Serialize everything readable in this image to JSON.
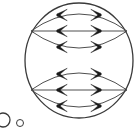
{
  "figure": {
    "background_color": "#ffffff",
    "stroke_color": "#3a3a3a",
    "fill_color": "#1a1a1a",
    "canvas": {
      "width": 140,
      "height": 139
    },
    "outer_circle": {
      "name": "outer-boundary-circle",
      "cx": 79,
      "cy": 60.5,
      "rx": 54,
      "ry": 57.5,
      "stroke_width": 1.3
    },
    "divider_line": {
      "name": "horizontal-divider",
      "x1": 25,
      "y1": 60.5,
      "x2": 133,
      "y2": 60.5,
      "stroke_width": 1.3
    },
    "halves": [
      {
        "name": "upper-half",
        "lens": {
          "left_tip_x": 31,
          "right_tip_x": 127,
          "center_y": 31,
          "bulge": 17
        },
        "midline": {
          "x1": 33,
          "x2": 125,
          "y": 31,
          "stroke_width": 0.9
        },
        "chevrons_left": [
          {
            "cx": 62,
            "cy": 15
          },
          {
            "cx": 62,
            "cy": 31
          },
          {
            "cx": 62,
            "cy": 47
          }
        ],
        "chevrons_right": [
          {
            "cx": 96,
            "cy": 15
          },
          {
            "cx": 96,
            "cy": 31
          },
          {
            "cx": 96,
            "cy": 47
          }
        ]
      },
      {
        "name": "lower-half",
        "lens": {
          "left_tip_x": 31,
          "right_tip_x": 127,
          "center_y": 90,
          "bulge": 17
        },
        "midline": {
          "x1": 33,
          "x2": 125,
          "y": 90,
          "stroke_width": 0.9
        },
        "chevrons_left": [
          {
            "cx": 62,
            "cy": 74
          },
          {
            "cx": 62,
            "cy": 90
          },
          {
            "cx": 62,
            "cy": 106
          }
        ],
        "chevrons_right": [
          {
            "cx": 96,
            "cy": 74
          },
          {
            "cx": 96,
            "cy": 90
          },
          {
            "cx": 96,
            "cy": 106
          }
        ]
      }
    ],
    "small_circles": [
      {
        "name": "small-circle-clipped",
        "cx": 3,
        "cy": 120,
        "r": 7,
        "stroke_width": 1.3
      },
      {
        "name": "small-circle-dot",
        "cx": 20,
        "cy": 123,
        "r": 3.5,
        "stroke_width": 1.0
      }
    ]
  }
}
